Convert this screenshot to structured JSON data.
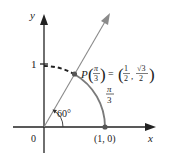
{
  "diagram": {
    "axes": {
      "x_label": "x",
      "y_label": "y",
      "origin_label": "0",
      "y_tick_label": "1",
      "x_point_label": "(1, 0)"
    },
    "angle": {
      "label": "60°"
    },
    "arc": {
      "label_numerator": "π",
      "label_denominator": "3"
    },
    "point": {
      "name": "P",
      "arg_numerator": "π",
      "arg_denominator": "3",
      "equals": "=",
      "x_numerator": "1",
      "x_denominator": "2",
      "comma": ",",
      "y_numerator": "√3",
      "y_denominator": "2"
    },
    "colors": {
      "axis": "#222222",
      "ray": "#8a8a8a",
      "arc": "#7a7a7a",
      "dashed_arc": "#222222",
      "point": "#555555"
    }
  }
}
